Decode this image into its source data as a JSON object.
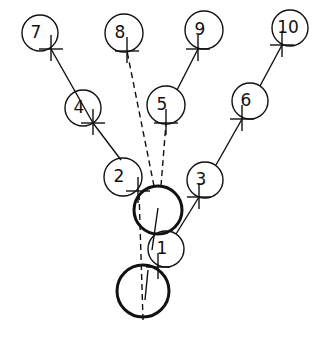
{
  "diagram": {
    "title": "",
    "nodes": [
      {
        "id": "7",
        "label": "7",
        "cx": 40,
        "cy": 33,
        "r": 18,
        "cross": [
          51,
          49
        ]
      },
      {
        "id": "8",
        "label": "8",
        "cx": 124,
        "cy": 33,
        "r": 19,
        "cross": [
          127,
          51
        ]
      },
      {
        "id": "9",
        "label": "9",
        "cx": 204,
        "cy": 30,
        "r": 19,
        "cross": [
          198,
          49
        ]
      },
      {
        "id": "10",
        "label": "10",
        "cx": 290,
        "cy": 28,
        "r": 18,
        "cross": [
          282,
          45
        ]
      },
      {
        "id": "4",
        "label": "4",
        "cx": 83,
        "cy": 108,
        "r": 18,
        "cross": [
          93,
          123
        ]
      },
      {
        "id": "5",
        "label": "5",
        "cx": 166,
        "cy": 105,
        "r": 19,
        "cross": [
          166,
          123
        ]
      },
      {
        "id": "6",
        "label": "6",
        "cx": 250,
        "cy": 101,
        "r": 18,
        "cross": [
          242,
          119
        ]
      },
      {
        "id": "2",
        "label": "2",
        "cx": 123,
        "cy": 177,
        "r": 19,
        "cross": [
          138,
          191
        ]
      },
      {
        "id": "3",
        "label": "3",
        "cx": 205,
        "cy": 180,
        "r": 18,
        "cross": [
          199,
          197
        ]
      },
      {
        "id": "1",
        "label": "1",
        "cx": 166,
        "cy": 249,
        "r": 18,
        "cross": [
          158,
          267
        ]
      }
    ],
    "bold_circles": [
      {
        "id": "upper-bold",
        "cx": 158,
        "cy": 210,
        "r": 24
      },
      {
        "id": "lower-bold",
        "cx": 143,
        "cy": 291,
        "r": 26
      }
    ],
    "solid_edges": [
      {
        "from": "4",
        "to": "7",
        "x1": 93,
        "y1": 123,
        "x2": 51,
        "y2": 49
      },
      {
        "from": "2",
        "to": "4",
        "x1": 121,
        "y1": 160,
        "x2": 93,
        "y2": 123
      },
      {
        "from": "5",
        "to": "9",
        "x1": 177,
        "y1": 90,
        "x2": 198,
        "y2": 49
      },
      {
        "from": "6",
        "to": "10",
        "x1": 260,
        "y1": 86,
        "x2": 282,
        "y2": 45
      },
      {
        "from": "3",
        "to": "6",
        "x1": 216,
        "y1": 165,
        "x2": 242,
        "y2": 119
      },
      {
        "from": "1",
        "to": "3",
        "x1": 176,
        "y1": 234,
        "x2": 199,
        "y2": 197
      },
      {
        "from": "bold-upper-inner",
        "to": "",
        "x1": 158,
        "y1": 208,
        "x2": 152,
        "y2": 250
      },
      {
        "from": "bold-lower-inner",
        "to": "",
        "x1": 148,
        "y1": 270,
        "x2": 145,
        "y2": 300
      }
    ],
    "dashed_edges": [
      {
        "from": "upper-bold",
        "to": "8",
        "x1": 154,
        "y1": 186,
        "x2": 127,
        "y2": 51
      },
      {
        "from": "upper-bold",
        "to": "5",
        "x1": 161,
        "y1": 186,
        "x2": 166,
        "y2": 123
      },
      {
        "from": "lower-bold",
        "to": "2",
        "x1": 143,
        "y1": 320,
        "x2": 139,
        "y2": 192
      }
    ],
    "colors": {
      "stroke": "#111111",
      "background": "#ffffff"
    }
  }
}
